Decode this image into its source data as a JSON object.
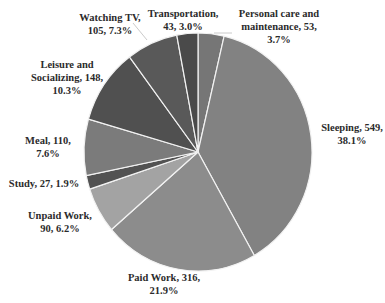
{
  "chart_data": {
    "type": "pie",
    "title": "",
    "start_angle_deg": 0,
    "direction": "clockwise",
    "total": 1441,
    "slices": [
      {
        "label": "Personal care and maintenance",
        "value": 53,
        "percent": 3.7,
        "color": "#767676",
        "text": "Personal care and\nmaintenance, 53,\n3.7%"
      },
      {
        "label": "Sleeping",
        "value": 549,
        "percent": 38.1,
        "color": "#828282",
        "text": "Sleeping, 549,\n38.1%"
      },
      {
        "label": "Paid Work",
        "value": 316,
        "percent": 21.9,
        "color": "#8c8c8c",
        "text": "Paid Work, 316,\n21.9%"
      },
      {
        "label": "Unpaid Work",
        "value": 90,
        "percent": 6.2,
        "color": "#a3a3a3",
        "text": "Unpaid Work,\n90, 6.2%"
      },
      {
        "label": "Study",
        "value": 27,
        "percent": 1.9,
        "color": "#525252",
        "text": "Study, 27, 1.9%"
      },
      {
        "label": "Meal",
        "value": 110,
        "percent": 7.6,
        "color": "#7b7b7b",
        "text": "Meal, 110,\n7.6%"
      },
      {
        "label": "Leisure and Socializing",
        "value": 148,
        "percent": 10.3,
        "color": "#505050",
        "text": "Leisure and\nSocializing, 148,\n10.3%"
      },
      {
        "label": "Watching TV",
        "value": 105,
        "percent": 7.3,
        "color": "#595959",
        "text": "Watching TV,\n105, 7.3%"
      },
      {
        "label": "Transportation",
        "value": 43,
        "percent": 3.0,
        "color": "#4a4a4a",
        "text": "Transportation,\n43, 3.0%"
      }
    ],
    "legend": "none",
    "data_labels": "category, value, percent"
  },
  "labels": {
    "personal_care": "Personal care and\nmaintenance, 53,\n3.7%",
    "sleeping": "Sleeping, 549,\n38.1%",
    "paid_work": "Paid Work, 316,\n21.9%",
    "unpaid_work": "Unpaid Work,\n90, 6.2%",
    "study": "Study, 27, 1.9%",
    "meal": "Meal, 110,\n7.6%",
    "leisure": "Leisure and\nSocializing, 148,\n10.3%",
    "watching_tv": "Watching TV,\n105, 7.3%",
    "transportation": "Transportation,\n43, 3.0%"
  }
}
